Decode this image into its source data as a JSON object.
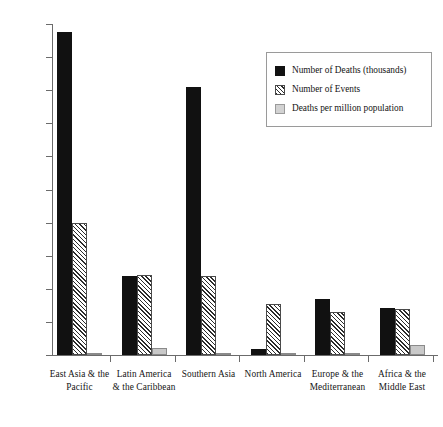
{
  "chart_data": {
    "type": "bar",
    "title": "",
    "subtitle": "",
    "xlabel": "",
    "ylabel": "",
    "ylim": [
      0,
      1000
    ],
    "ytick_step": 100,
    "yticks": [
      0,
      100,
      200,
      300,
      400,
      500,
      600,
      700,
      800,
      900,
      1000
    ],
    "ytick_labels": [
      "0",
      "100",
      "200",
      "300",
      "400",
      "500",
      "600",
      "700",
      "800",
      "900",
      "1000"
    ],
    "grid": false,
    "legend_position": "upper right",
    "categories": [
      "East Asia & the Pacific",
      "Latin America & the Caribbean",
      "Southern Asia",
      "North America",
      "Europe & the Mediterranean",
      "Africa & the Middle East"
    ],
    "category_lines": [
      [
        "East Asia & the",
        "Pacific"
      ],
      [
        "Latin America",
        "& the Caribbean"
      ],
      [
        "Southern Asia",
        ""
      ],
      [
        "North America",
        ""
      ],
      [
        "Europe & the",
        "Mediterranean"
      ],
      [
        "Africa & the",
        "Middle East"
      ]
    ],
    "series": [
      {
        "name": "Number of Deaths (thousands)",
        "key": "s-deaths",
        "color": "#111111",
        "fill": "solid",
        "values": [
          975,
          240,
          810,
          18,
          170,
          142
        ]
      },
      {
        "name": "Number of Events",
        "key": "s-events",
        "color": "#2b2b2b",
        "fill": "diagonal-hatch",
        "values": [
          400,
          243,
          238,
          155,
          130,
          140
        ]
      },
      {
        "name": "Deaths per million population",
        "key": "s-permillion",
        "color": "#c9c9c9",
        "fill": "light-gray",
        "values": [
          5,
          20,
          5,
          3,
          4,
          30
        ]
      }
    ]
  },
  "legend": {
    "entries": [
      {
        "label": "Number of Deaths (thousands)",
        "swatch": "s-deaths"
      },
      {
        "label": "Number of Events",
        "swatch": "s-events"
      },
      {
        "label": "Deaths per million population",
        "swatch": "s-permillion"
      }
    ]
  }
}
